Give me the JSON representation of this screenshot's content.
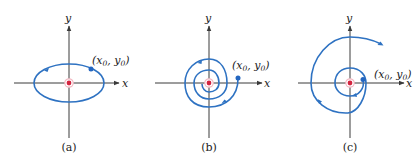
{
  "figure": {
    "colors": {
      "axis": "#3a3a3a",
      "trajectory": "#2e72c2",
      "equilibrium": "#d4243f",
      "equilibrium_ring": "#f2b8c2",
      "start_point": "#2466c0"
    },
    "panels": [
      {
        "id": "a",
        "caption": "(a)",
        "behavior": "closed orbit (center)",
        "x_axis_label": "x",
        "y_axis_label": "y",
        "x_label_base": "x",
        "x_label_sub": "0",
        "y_label_base": "y",
        "y_label_sub": "0",
        "sep": ", ",
        "open": "(",
        "close": ")"
      },
      {
        "id": "b",
        "caption": "(b)",
        "behavior": "spiral inward (stable spiral)",
        "x_axis_label": "x",
        "y_axis_label": "y",
        "x_label_base": "x",
        "x_label_sub": "0",
        "y_label_base": "y",
        "y_label_sub": "0",
        "sep": ", ",
        "open": "(",
        "close": ")"
      },
      {
        "id": "c",
        "caption": "(c)",
        "behavior": "spiral outward (unstable spiral)",
        "x_axis_label": "x",
        "y_axis_label": "y",
        "x_label_base": "x",
        "x_label_sub": "0",
        "y_label_base": "y",
        "y_label_sub": "0",
        "sep": ", ",
        "open": "(",
        "close": ")"
      }
    ]
  }
}
